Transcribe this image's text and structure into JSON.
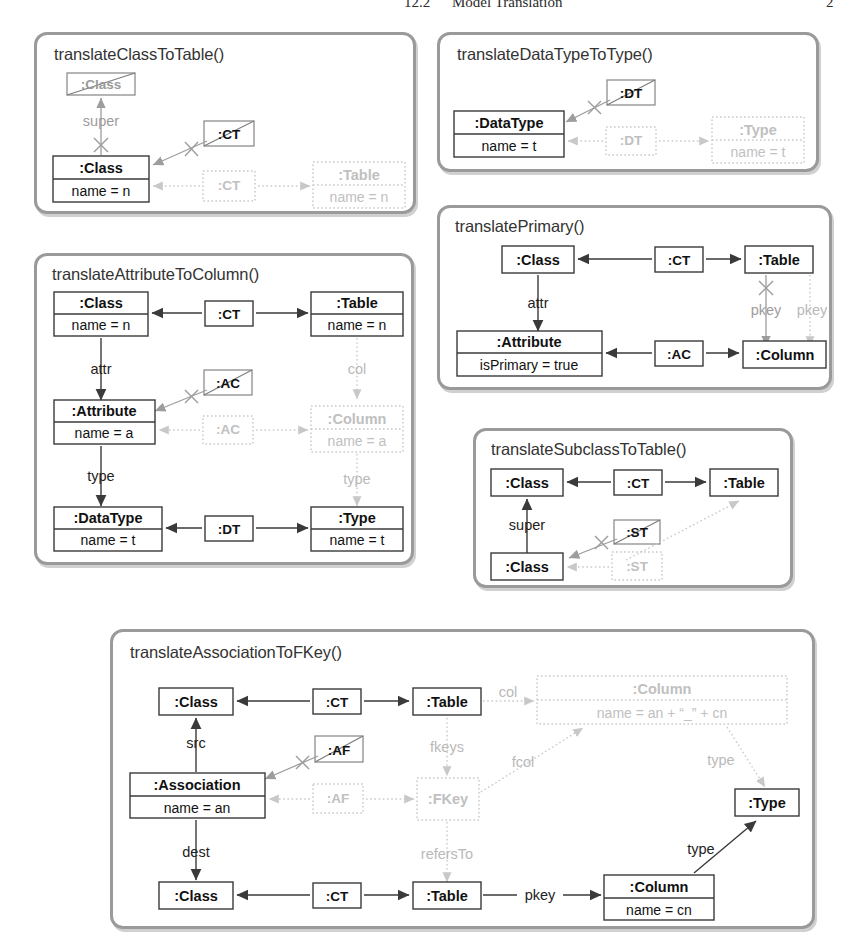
{
  "page_header": {
    "section_number": "12.2",
    "section_title": "Model Translation",
    "page_number": "2"
  },
  "diagram": {
    "type": "triple-graph-grammar-rules",
    "node_kinds": {
      "context": "solid black box (source/context element)",
      "created": "light gray dotted box (created / correspondence element)",
      "nac": "gray box with diagonal slash (negative application condition)"
    },
    "panels": [
      {
        "id": "translateClassToTable",
        "title": "translateClassToTable()",
        "nodes": [
          {
            "name": ":Class",
            "attr": "",
            "kind": "nac"
          },
          {
            "name": ":Class",
            "attr": "name = n",
            "kind": "context"
          },
          {
            "name": ":CT",
            "attr": "",
            "kind": "nac"
          },
          {
            "name": ":CT",
            "attr": "",
            "kind": "created"
          },
          {
            "name": ":Table",
            "attr": "name = n",
            "kind": "created"
          }
        ],
        "edges": [
          {
            "label": "super",
            "kind": "nac"
          },
          {
            "label": "",
            "kind": "nac"
          },
          {
            "label": "",
            "kind": "created"
          },
          {
            "label": "",
            "kind": "created"
          }
        ]
      },
      {
        "id": "translateDataTypeToType",
        "title": "translateDataTypeToType()",
        "nodes": [
          {
            "name": ":DT",
            "attr": "",
            "kind": "nac"
          },
          {
            "name": ":DataType",
            "attr": "name = t",
            "kind": "context"
          },
          {
            "name": ":DT",
            "attr": "",
            "kind": "created"
          },
          {
            "name": ":Type",
            "attr": "name = t",
            "kind": "created"
          }
        ],
        "edges": [
          {
            "label": "",
            "kind": "nac"
          },
          {
            "label": "",
            "kind": "created"
          },
          {
            "label": "",
            "kind": "created"
          }
        ]
      },
      {
        "id": "translateAttributeToColumn",
        "title": "translateAttributeToColumn()",
        "nodes": [
          {
            "name": ":Class",
            "attr": "name = n",
            "kind": "context"
          },
          {
            "name": ":CT",
            "attr": "",
            "kind": "context"
          },
          {
            "name": ":Table",
            "attr": "name = n",
            "kind": "context"
          },
          {
            "name": ":AC",
            "attr": "",
            "kind": "nac"
          },
          {
            "name": ":Attribute",
            "attr": "name = a",
            "kind": "context"
          },
          {
            "name": ":AC",
            "attr": "",
            "kind": "created"
          },
          {
            "name": ":Column",
            "attr": "name = a",
            "kind": "created"
          },
          {
            "name": ":DataType",
            "attr": "name = t",
            "kind": "context"
          },
          {
            "name": ":DT",
            "attr": "",
            "kind": "context"
          },
          {
            "name": ":Type",
            "attr": "name = t",
            "kind": "context"
          }
        ],
        "edges": [
          {
            "label": "attr",
            "kind": "context"
          },
          {
            "label": "type",
            "kind": "context"
          },
          {
            "label": "col",
            "kind": "created"
          },
          {
            "label": "type",
            "kind": "created"
          },
          {
            "label": "",
            "kind": "nac"
          },
          {
            "label": "",
            "kind": "created"
          }
        ]
      },
      {
        "id": "translatePrimary",
        "title": "translatePrimary()",
        "nodes": [
          {
            "name": ":Class",
            "attr": "",
            "kind": "context"
          },
          {
            "name": ":CT",
            "attr": "",
            "kind": "context"
          },
          {
            "name": ":Table",
            "attr": "",
            "kind": "context"
          },
          {
            "name": ":Attribute",
            "attr": "isPrimary = true",
            "kind": "context"
          },
          {
            "name": ":AC",
            "attr": "",
            "kind": "context"
          },
          {
            "name": ":Column",
            "attr": "",
            "kind": "context"
          }
        ],
        "edges": [
          {
            "label": "attr",
            "kind": "context"
          },
          {
            "label": "pkey",
            "kind": "nac"
          },
          {
            "label": "pkey",
            "kind": "created"
          }
        ]
      },
      {
        "id": "translateSubclassToTable",
        "title": "translateSubclassToTable()",
        "nodes": [
          {
            "name": ":Class",
            "attr": "",
            "kind": "context"
          },
          {
            "name": ":CT",
            "attr": "",
            "kind": "context"
          },
          {
            "name": ":Table",
            "attr": "",
            "kind": "context"
          },
          {
            "name": ":ST",
            "attr": "",
            "kind": "nac"
          },
          {
            "name": ":Class",
            "attr": "",
            "kind": "context"
          },
          {
            "name": ":ST",
            "attr": "",
            "kind": "created"
          }
        ],
        "edges": [
          {
            "label": "super",
            "kind": "context"
          },
          {
            "label": "",
            "kind": "nac"
          },
          {
            "label": "",
            "kind": "created"
          }
        ]
      },
      {
        "id": "translateAssociationToFKey",
        "title": "translateAssociationToFKey()",
        "nodes": [
          {
            "name": ":Class",
            "attr": "",
            "kind": "context"
          },
          {
            "name": ":CT",
            "attr": "",
            "kind": "context"
          },
          {
            "name": ":Table",
            "attr": "",
            "kind": "context"
          },
          {
            "name": ":Column",
            "attr": "name = an + “_” + cn",
            "kind": "created"
          },
          {
            "name": ":AF",
            "attr": "",
            "kind": "nac"
          },
          {
            "name": ":Association",
            "attr": "name = an",
            "kind": "context"
          },
          {
            "name": ":AF",
            "attr": "",
            "kind": "created"
          },
          {
            "name": ":FKey",
            "attr": "",
            "kind": "created"
          },
          {
            "name": ":Type",
            "attr": "",
            "kind": "context"
          },
          {
            "name": ":Class",
            "attr": "",
            "kind": "context"
          },
          {
            "name": ":CT",
            "attr": "",
            "kind": "context"
          },
          {
            "name": ":Table",
            "attr": "",
            "kind": "context"
          },
          {
            "name": ":Column",
            "attr": "name = cn",
            "kind": "context"
          }
        ],
        "edges": [
          {
            "label": "src",
            "kind": "context"
          },
          {
            "label": "dest",
            "kind": "context"
          },
          {
            "label": "pkey",
            "kind": "context"
          },
          {
            "label": "type",
            "kind": "context"
          },
          {
            "label": "col",
            "kind": "created"
          },
          {
            "label": "fkeys",
            "kind": "created"
          },
          {
            "label": "fcol",
            "kind": "created"
          },
          {
            "label": "type",
            "kind": "created"
          },
          {
            "label": "refersTo",
            "kind": "created"
          },
          {
            "label": "",
            "kind": "nac"
          },
          {
            "label": "",
            "kind": "created"
          }
        ]
      }
    ]
  },
  "colors": {
    "panel_border": "#9a9a9a",
    "context": "#111111",
    "nac": "#9a9a9a",
    "created": "#c0c0c0"
  }
}
